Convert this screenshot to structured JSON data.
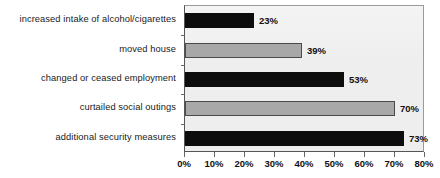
{
  "chart_data": {
    "type": "bar",
    "orientation": "horizontal",
    "title": "",
    "xlabel": "",
    "ylabel": "",
    "categories": [
      "increased intake of alcohol/cigarettes",
      "moved house",
      "changed or ceased employment",
      "curtailed social outings",
      "additional security measures"
    ],
    "values": [
      23,
      39,
      53,
      70,
      73
    ],
    "data_labels": [
      "23%",
      "39%",
      "53%",
      "70%",
      "73%"
    ],
    "bar_colors": [
      "#0d0d0d",
      "#a8a8a8",
      "#0d0d0d",
      "#a8a8a8",
      "#0d0d0d"
    ],
    "xlim": [
      0,
      80
    ],
    "xticks": [
      0,
      10,
      20,
      30,
      40,
      50,
      60,
      70,
      80
    ],
    "xtick_labels": [
      "0%",
      "10%",
      "20%",
      "30%",
      "40%",
      "50%",
      "60%",
      "70%",
      "80%"
    ],
    "grid": false,
    "legend": "none",
    "plot_background": "#eeeeee",
    "value_unit": "%"
  }
}
